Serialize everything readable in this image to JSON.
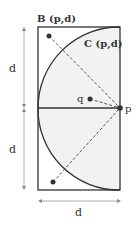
{
  "diagram": {
    "labels": {
      "region_b": "B (p,d)",
      "region_c": "C (p,d)",
      "point_q": "q",
      "point_p": "p",
      "dim_upper": "d",
      "dim_lower": "d",
      "dim_width": "d"
    },
    "colors": {
      "stroke": "#333333",
      "fill_region": "#f2f2f2",
      "dim_line": "#999999"
    }
  }
}
